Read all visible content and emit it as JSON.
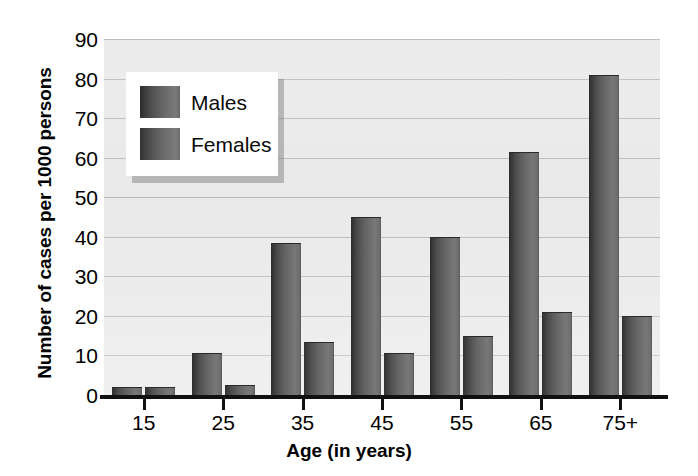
{
  "chart_data": {
    "type": "bar",
    "title": "",
    "xlabel": "Age (in years)",
    "ylabel": "Number of cases per 1000 persons",
    "categories": [
      "15",
      "25",
      "35",
      "45",
      "55",
      "65",
      "75+"
    ],
    "series": [
      {
        "name": "Males",
        "values": [
          2,
          10.5,
          38.5,
          45,
          40,
          61.5,
          81
        ]
      },
      {
        "name": "Females",
        "values": [
          2,
          2.5,
          13.5,
          10.5,
          15,
          21,
          20
        ]
      }
    ],
    "ylim": [
      0,
      90
    ],
    "y_ticks": [
      0,
      10,
      20,
      30,
      40,
      50,
      60,
      70,
      80,
      90
    ],
    "y_tick_labels": [
      "0",
      "10",
      "20",
      "30",
      "40",
      "50",
      "60",
      "70",
      "80",
      "90"
    ],
    "grid": true,
    "legend_position": "top-left-inside",
    "colors": {
      "males": "#5a5a5a",
      "females": "#646464",
      "plot_background": "#e9e9e9",
      "gridline": "#b9b9b9",
      "axis": "#111111",
      "page_background": "#ffffff",
      "legend_background": "#ffffff",
      "text": "#000000"
    }
  },
  "legend": {
    "items": [
      {
        "label": "Males"
      },
      {
        "label": "Females"
      }
    ]
  },
  "axes": {
    "y_title": "Number of cases per 1000 persons",
    "x_title": "Age (in years)"
  }
}
